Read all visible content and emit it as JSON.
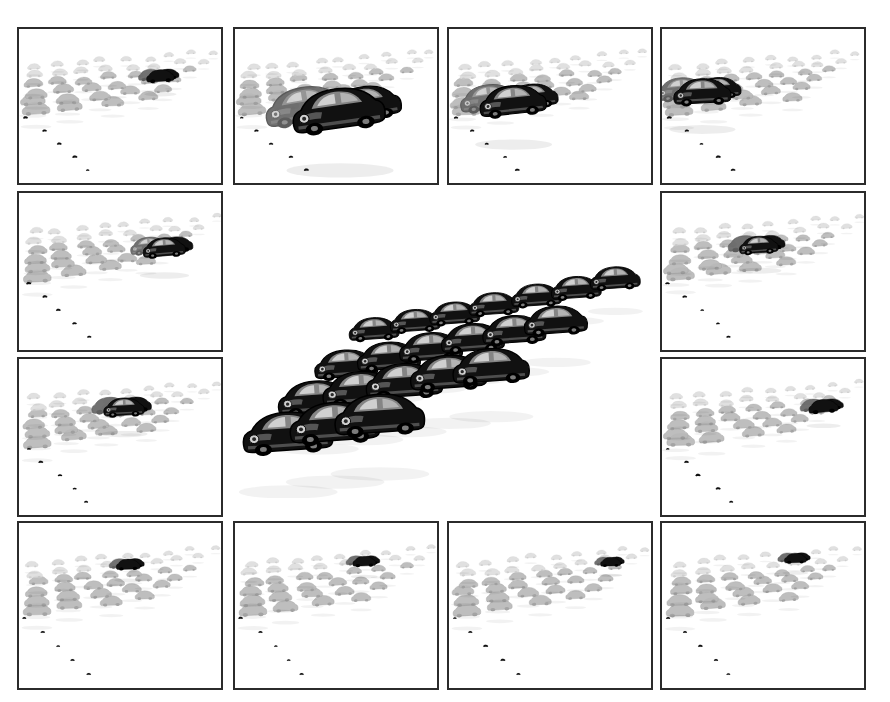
{
  "figure": {
    "background_color": "#ffffff",
    "border_color": "#2b2b2b",
    "panel_count": 12,
    "center_panel_label": "center-overview-render",
    "object_name": "car",
    "render_style": "halftone-shaded-grayscale",
    "colors": {
      "ink_dark": "#111111",
      "ink_mid": "#6a6a6a",
      "ink_light": "#b9b9b9",
      "ink_faint": "#dcdcdc",
      "frame": "#2b2b2b",
      "paper": "#ffffff"
    }
  },
  "layout": {
    "width": 890,
    "height": 702,
    "rows": [
      {
        "name": "top-row",
        "y": 27,
        "h": 158
      },
      {
        "name": "middle-row-1",
        "y": 191,
        "h": 161
      },
      {
        "name": "middle-row-2",
        "y": 357,
        "h": 160
      },
      {
        "name": "bottom-row",
        "y": 521,
        "h": 169
      }
    ],
    "columns": [
      {
        "name": "col-1",
        "x": 17,
        "w": 206
      },
      {
        "name": "col-2",
        "x": 233,
        "w": 206
      },
      {
        "name": "col-3",
        "x": 447,
        "w": 206
      },
      {
        "name": "col-4",
        "x": 660,
        "w": 206
      }
    ]
  },
  "panels": [
    {
      "id": "panel-top-1",
      "name": "viewpoint-render-top-left",
      "position": {
        "x": 17,
        "y": 27,
        "w": 206,
        "h": 158
      },
      "camera": "distant-high-rear",
      "primary_instance": {
        "cx": 0.7,
        "cy": 0.34,
        "scale": 0.3,
        "tone": "dark",
        "rot": -4
      },
      "cloud_density": "high",
      "caption": ""
    },
    {
      "id": "panel-top-2",
      "name": "viewpoint-render-top-second",
      "position": {
        "x": 233,
        "y": 27,
        "w": 206,
        "h": 158
      },
      "camera": "near-front-three-quarter",
      "primary_instance": {
        "cx": 0.52,
        "cy": 0.64,
        "scale": 1.0,
        "tone": "dark",
        "rot": -8
      },
      "cloud_density": "high",
      "caption": ""
    },
    {
      "id": "panel-top-3",
      "name": "viewpoint-render-top-third",
      "position": {
        "x": 447,
        "y": 27,
        "w": 206,
        "h": 158
      },
      "camera": "mid-left-three-quarter",
      "primary_instance": {
        "cx": 0.32,
        "cy": 0.55,
        "scale": 0.72,
        "tone": "dark",
        "rot": -6
      },
      "cloud_density": "high",
      "caption": ""
    },
    {
      "id": "panel-top-4",
      "name": "viewpoint-render-top-right",
      "position": {
        "x": 660,
        "y": 27,
        "w": 206,
        "h": 158
      },
      "camera": "far-left-side",
      "primary_instance": {
        "cx": 0.2,
        "cy": 0.48,
        "scale": 0.62,
        "tone": "dark",
        "rot": -3
      },
      "cloud_density": "high",
      "caption": ""
    },
    {
      "id": "panel-mid-left-1",
      "name": "viewpoint-render-mid-left-upper",
      "position": {
        "x": 17,
        "y": 191,
        "w": 206,
        "h": 161
      },
      "camera": "mid-right-cluster",
      "primary_instance": {
        "cx": 0.72,
        "cy": 0.4,
        "scale": 0.46,
        "tone": "dark",
        "rot": -5
      },
      "cloud_density": "high",
      "caption": ""
    },
    {
      "id": "panel-mid-right-1",
      "name": "viewpoint-render-mid-right-upper",
      "position": {
        "x": 660,
        "y": 191,
        "w": 206,
        "h": 161
      },
      "camera": "mid-center-wide",
      "primary_instance": {
        "cx": 0.48,
        "cy": 0.38,
        "scale": 0.42,
        "tone": "dark",
        "rot": -4
      },
      "cloud_density": "high",
      "caption": ""
    },
    {
      "id": "panel-mid-left-2",
      "name": "viewpoint-render-mid-left-lower",
      "position": {
        "x": 17,
        "y": 357,
        "w": 206,
        "h": 160
      },
      "camera": "low-wide-row",
      "primary_instance": {
        "cx": 0.52,
        "cy": 0.36,
        "scale": 0.44,
        "tone": "dark",
        "rot": -3
      },
      "cloud_density": "high",
      "caption": ""
    },
    {
      "id": "panel-mid-right-2",
      "name": "viewpoint-render-mid-right-lower",
      "position": {
        "x": 660,
        "y": 357,
        "w": 206,
        "h": 160
      },
      "camera": "far-right-cluster",
      "primary_instance": {
        "cx": 0.8,
        "cy": 0.34,
        "scale": 0.32,
        "tone": "dark",
        "rot": -5
      },
      "cloud_density": "high",
      "caption": ""
    },
    {
      "id": "panel-bottom-1",
      "name": "viewpoint-render-bottom-left",
      "position": {
        "x": 17,
        "y": 521,
        "w": 206,
        "h": 169
      },
      "camera": "distant-compact-cluster",
      "primary_instance": {
        "cx": 0.54,
        "cy": 0.28,
        "scale": 0.26,
        "tone": "dark",
        "rot": -2
      },
      "cloud_density": "high",
      "caption": ""
    },
    {
      "id": "panel-bottom-2",
      "name": "viewpoint-render-bottom-second",
      "position": {
        "x": 233,
        "y": 521,
        "w": 206,
        "h": 169
      },
      "camera": "distant-compact-cluster-b",
      "primary_instance": {
        "cx": 0.64,
        "cy": 0.26,
        "scale": 0.25,
        "tone": "dark",
        "rot": -2
      },
      "cloud_density": "high",
      "caption": ""
    },
    {
      "id": "panel-bottom-3",
      "name": "viewpoint-render-bottom-third",
      "position": {
        "x": 447,
        "y": 521,
        "w": 206,
        "h": 169
      },
      "camera": "distant-right-cluster",
      "primary_instance": {
        "cx": 0.8,
        "cy": 0.26,
        "scale": 0.22,
        "tone": "dark",
        "rot": -2
      },
      "cloud_density": "high",
      "caption": ""
    },
    {
      "id": "panel-bottom-4",
      "name": "viewpoint-render-bottom-right",
      "position": {
        "x": 660,
        "y": 521,
        "w": 206,
        "h": 169
      },
      "camera": "distant-center-cluster",
      "primary_instance": {
        "cx": 0.66,
        "cy": 0.24,
        "scale": 0.24,
        "tone": "dark",
        "rot": -2
      },
      "cloud_density": "high",
      "caption": ""
    }
  ],
  "center_render": {
    "id": "center-overview",
    "name": "center-overview-render",
    "position": {
      "x": 228,
      "y": 258,
      "w": 432,
      "h": 240
    },
    "description": "Large triangular formation of car instances receding to the upper right",
    "rows_of_cars": [
      3,
      5,
      6,
      7
    ],
    "total_instances": 21,
    "caption": ""
  }
}
